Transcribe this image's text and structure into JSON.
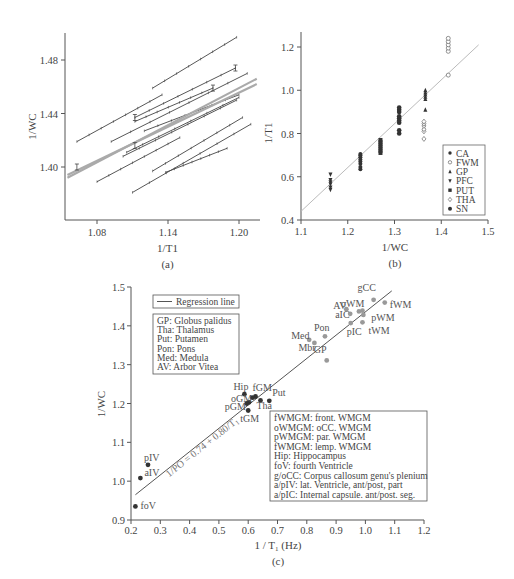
{
  "chart_data": [
    {
      "id": "a",
      "type": "line",
      "panel_label": "(a)",
      "title": "",
      "xlabel": "1/T1",
      "ylabel": "1/WC",
      "xlim": [
        1.055,
        1.215
      ],
      "ylim": [
        1.36,
        1.5
      ],
      "xticks": [
        "1.08",
        "1.14",
        "1.20"
      ],
      "yticks": [
        "1.40",
        "1.44",
        "1.48"
      ],
      "grid": false,
      "series": [
        {
          "name": "line-1",
          "x": [
            1.127,
            1.198
          ],
          "y": [
            1.459,
            1.497
          ]
        },
        {
          "name": "line-2",
          "x": [
            1.063,
            1.135
          ],
          "y": [
            1.419,
            1.454
          ]
        },
        {
          "name": "line-3",
          "x": [
            1.112,
            1.197
          ],
          "y": [
            1.437,
            1.474
          ]
        },
        {
          "name": "line-4",
          "x": [
            1.092,
            1.207
          ],
          "y": [
            1.419,
            1.47
          ]
        },
        {
          "name": "line-5",
          "x": [
            1.112,
            1.178
          ],
          "y": [
            1.434,
            1.459
          ]
        },
        {
          "name": "line-6",
          "x": [
            1.12,
            1.2
          ],
          "y": [
            1.427,
            1.454
          ]
        },
        {
          "name": "line-7",
          "x": [
            1.105,
            1.2
          ],
          "y": [
            1.411,
            1.452
          ]
        },
        {
          "name": "line-8",
          "x": [
            1.102,
            1.198
          ],
          "y": [
            1.408,
            1.45
          ]
        },
        {
          "name": "line-9",
          "x": [
            1.08,
            1.15
          ],
          "y": [
            1.389,
            1.422
          ]
        },
        {
          "name": "line-10",
          "x": [
            1.127,
            1.203
          ],
          "y": [
            1.397,
            1.437
          ]
        },
        {
          "name": "line-11",
          "x": [
            1.138,
            1.19
          ],
          "y": [
            1.396,
            1.414
          ]
        },
        {
          "name": "line-12",
          "x": [
            1.11,
            1.21
          ],
          "y": [
            1.381,
            1.432
          ]
        },
        {
          "name": "regression-1 (gray)",
          "x": [
            1.055,
            1.215
          ],
          "y": [
            1.392,
            1.466
          ]
        },
        {
          "name": "regression-2 (gray)",
          "x": [
            1.055,
            1.215
          ],
          "y": [
            1.394,
            1.462
          ]
        }
      ],
      "error_bars": [
        {
          "x": 1.063,
          "y": 1.4
        },
        {
          "x": 1.112,
          "y": 1.437
        },
        {
          "x": 1.197,
          "y": 1.474
        },
        {
          "x": 1.178,
          "y": 1.459
        },
        {
          "x": 1.112,
          "y": 1.416
        }
      ]
    },
    {
      "id": "b",
      "type": "scatter",
      "panel_label": "(b)",
      "title": "",
      "xlabel": "1/WC",
      "ylabel": "1/T1",
      "xlim": [
        1.1,
        1.5
      ],
      "ylim": [
        0.4,
        1.27
      ],
      "xticks": [
        "1.1",
        "1.2",
        "1.3",
        "1.4",
        "1.5"
      ],
      "yticks": [
        "0.4",
        "0.6",
        "0.8",
        "1.0",
        "1.2"
      ],
      "grid": false,
      "legend_position": "lower right",
      "legend": [
        "CA",
        "FWM",
        "GP",
        "PFC",
        "PUT",
        "THA",
        "SN"
      ],
      "fit_line": {
        "x": [
          1.1,
          1.48
        ],
        "y": [
          0.44,
          1.21
        ]
      },
      "series": [
        {
          "name": "PFC",
          "marker": "triangle-down",
          "x": [
            1.163,
            1.163,
            1.163,
            1.163,
            1.163,
            1.163
          ],
          "y": [
            0.54,
            0.55,
            0.565,
            0.575,
            0.585,
            0.61
          ]
        },
        {
          "name": "CA",
          "marker": "circle-filled",
          "x": [
            1.227,
            1.227,
            1.227,
            1.227,
            1.227,
            1.227,
            1.227,
            1.227
          ],
          "y": [
            0.635,
            0.645,
            0.66,
            0.67,
            0.68,
            0.69,
            0.7,
            0.705
          ]
        },
        {
          "name": "PUT",
          "marker": "square",
          "x": [
            1.27,
            1.27,
            1.27,
            1.27,
            1.27,
            1.27,
            1.27
          ],
          "y": [
            0.71,
            0.72,
            0.73,
            0.74,
            0.75,
            0.76,
            0.77
          ]
        },
        {
          "name": "SN",
          "marker": "star-filled",
          "x": [
            1.31,
            1.31,
            1.31,
            1.31,
            1.31,
            1.31,
            1.31,
            1.31,
            1.31
          ],
          "y": [
            0.8,
            0.815,
            0.85,
            0.86,
            0.87,
            0.88,
            0.9,
            0.91,
            0.92
          ]
        },
        {
          "name": "GP",
          "marker": "triangle-up",
          "x": [
            1.366,
            1.366,
            1.366,
            1.366,
            1.366,
            1.366
          ],
          "y": [
            0.91,
            0.96,
            0.97,
            0.98,
            0.99,
            1.0
          ]
        },
        {
          "name": "THA",
          "marker": "diamond-open",
          "x": [
            1.363,
            1.363,
            1.363,
            1.363,
            1.363,
            1.363
          ],
          "y": [
            0.775,
            0.81,
            0.82,
            0.835,
            0.845,
            0.855
          ]
        },
        {
          "name": "FWM",
          "marker": "circle-open",
          "x": [
            1.415,
            1.415,
            1.415,
            1.415,
            1.415,
            1.415
          ],
          "y": [
            1.07,
            1.18,
            1.195,
            1.21,
            1.225,
            1.24
          ]
        }
      ]
    },
    {
      "id": "c",
      "type": "scatter",
      "panel_label": "(c)",
      "title": "",
      "xlabel": "1 / T1 (Hz)",
      "ylabel": "1/WC",
      "xlim": [
        0.2,
        1.2
      ],
      "ylim": [
        0.9,
        1.5
      ],
      "xticks": [
        "0.2",
        "0.3",
        "0.4",
        "0.5",
        "0.6",
        "0.7",
        "0.8",
        "0.9",
        "1.0",
        "1.1",
        "1.2"
      ],
      "yticks": [
        "0.9",
        "1.0",
        "1.1",
        "1.2",
        "1.3",
        "1.4",
        "1.5"
      ],
      "grid": false,
      "regression": {
        "label": "Regression line",
        "equation": "1/PO = 0.74 + 0.80/T1",
        "x": [
          0.215,
          1.09
        ],
        "y": [
          0.965,
          1.49
        ]
      },
      "points": [
        {
          "label": "foV",
          "x": 0.215,
          "y": 0.935,
          "group": "dark"
        },
        {
          "label": "aIV",
          "x": 0.232,
          "y": 1.008,
          "group": "dark"
        },
        {
          "label": "pIV",
          "x": 0.258,
          "y": 1.042,
          "group": "dark"
        },
        {
          "label": "Hip",
          "x": 0.587,
          "y": 1.224,
          "group": "dark"
        },
        {
          "label": "oGM",
          "x": 0.603,
          "y": 1.203,
          "group": "dark"
        },
        {
          "label": "pGM",
          "x": 0.595,
          "y": 1.2,
          "group": "dark"
        },
        {
          "label": "tGM",
          "x": 0.6,
          "y": 1.182,
          "group": "dark"
        },
        {
          "label": "fGM",
          "x": 0.625,
          "y": 1.218,
          "group": "dark"
        },
        {
          "label": "",
          "x": 0.615,
          "y": 1.215,
          "group": "dark"
        },
        {
          "label": "Tha",
          "x": 0.642,
          "y": 1.208,
          "group": "dark"
        },
        {
          "label": "Put",
          "x": 0.672,
          "y": 1.207,
          "group": "dark"
        },
        {
          "label": "Med",
          "x": 0.808,
          "y": 1.364,
          "group": "light"
        },
        {
          "label": "Mbr",
          "x": 0.826,
          "y": 1.356,
          "group": "light"
        },
        {
          "label": "Pon",
          "x": 0.862,
          "y": 1.373,
          "group": "light"
        },
        {
          "label": "GP",
          "x": 0.868,
          "y": 1.311,
          "group": "light"
        },
        {
          "label": "AV",
          "x": 0.935,
          "y": 1.443,
          "group": "light"
        },
        {
          "label": "aIC",
          "x": 0.948,
          "y": 1.431,
          "group": "light"
        },
        {
          "label": "pIC",
          "x": 0.95,
          "y": 1.407,
          "group": "light"
        },
        {
          "label": "oWM",
          "x": 0.978,
          "y": 1.437,
          "group": "light"
        },
        {
          "label": "",
          "x": 0.99,
          "y": 1.439,
          "group": "light"
        },
        {
          "label": "pWM",
          "x": 0.993,
          "y": 1.428,
          "group": "light"
        },
        {
          "label": "tWM",
          "x": 0.99,
          "y": 1.409,
          "group": "light"
        },
        {
          "label": "gCC",
          "x": 1.028,
          "y": 1.467,
          "group": "light"
        },
        {
          "label": "fWM",
          "x": 1.066,
          "y": 1.46,
          "group": "light"
        }
      ],
      "legend_abbrev_top": [
        "GP: Globus palidus",
        "Tha: Thalamus",
        "Put: Putamen",
        "Pon: Pons",
        "Med: Medula",
        "AV: Arbor Vitea"
      ],
      "legend_abbrev_bottom": [
        "fWMGM: front. WMGM",
        "oWMGM: oCC. WMGM",
        "pWMGM: par. WMGM",
        "fWMGM: lemp. WMGM",
        "Hip: Hippocampus",
        "foV: fourth Ventricle",
        "g/oCC: Corpus callosum genu's plenium",
        "a/pIV: lat. Ventricle, ant/post, part",
        "a/pIC: Internal capsule. ant/post. seg."
      ]
    }
  ],
  "colors": {
    "axis": "#555555",
    "data_line": "#444444",
    "regression_gray": "#aaaaaa",
    "dark_point": "#333333",
    "light_point": "#999999",
    "fit_line_b": "#bbbbbb"
  }
}
